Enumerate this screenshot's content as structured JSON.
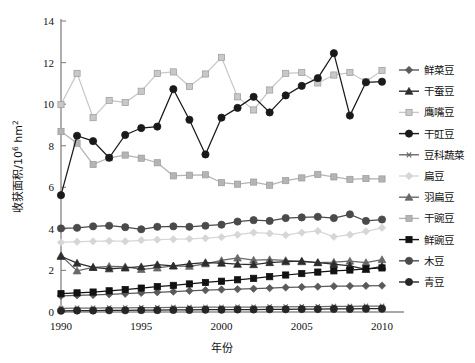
{
  "chart_data": {
    "type": "line",
    "title": "",
    "xlabel": "年份",
    "ylabel": "收获面积/10⁶ hm²",
    "ylabel_main": "收获面积/10",
    "ylabel_exp": "6",
    "ylabel_unit": " hm",
    "ylabel_unit_exp": "2",
    "xlim": [
      1990,
      2010
    ],
    "ylim": [
      0,
      14
    ],
    "ytick_values": [
      0,
      2,
      4,
      6,
      8,
      10,
      12,
      14
    ],
    "ytick_labels": [
      "0",
      "2",
      "4",
      "6",
      "8",
      "10",
      "12",
      "14"
    ],
    "xtick_values": [
      1990,
      1995,
      2000,
      2005,
      2010
    ],
    "xtick_labels": [
      "1990",
      "1995",
      "2000",
      "2005",
      "2010"
    ],
    "grid": false,
    "legend_position": "right",
    "x": [
      1990,
      1991,
      1992,
      1993,
      1994,
      1995,
      1996,
      1997,
      1998,
      1999,
      2000,
      2001,
      2002,
      2003,
      2004,
      2005,
      2006,
      2007,
      2008,
      2009,
      2010
    ],
    "series": [
      {
        "name": "鲜菜豆",
        "marker": "diamond",
        "color": "#5a5a5a",
        "values": [
          0.78,
          0.8,
          0.82,
          0.85,
          0.88,
          0.92,
          0.95,
          0.98,
          1.02,
          1.05,
          1.08,
          1.1,
          1.12,
          1.15,
          1.18,
          1.2,
          1.22,
          1.24,
          1.25,
          1.26,
          1.27
        ]
      },
      {
        "name": "干蚕豆",
        "marker": "triangle",
        "color": "#2d2d2d",
        "values": [
          2.68,
          2.35,
          2.15,
          2.08,
          2.12,
          2.18,
          2.28,
          2.22,
          2.32,
          2.38,
          2.35,
          2.3,
          2.28,
          2.38,
          2.42,
          2.45,
          2.38,
          2.3,
          2.22,
          2.05,
          2.2
        ]
      },
      {
        "name": "鹰嘴豆",
        "marker": "square",
        "color": "#c8c8c8",
        "values": [
          9.98,
          11.48,
          9.35,
          10.18,
          10.08,
          10.62,
          11.48,
          11.55,
          10.85,
          11.45,
          12.25,
          10.35,
          9.72,
          10.68,
          11.48,
          11.52,
          11.02,
          11.4,
          11.52,
          11.08,
          11.62
        ]
      },
      {
        "name": "干豇豆",
        "marker": "circle-filled",
        "color": "#1a1a1a",
        "values": [
          5.62,
          8.48,
          8.22,
          7.42,
          8.52,
          8.85,
          8.92,
          10.72,
          9.25,
          7.58,
          9.35,
          9.82,
          10.35,
          9.6,
          10.42,
          10.88,
          11.25,
          12.45,
          9.45,
          11.05,
          11.08
        ]
      },
      {
        "name": "豆科蔬菜",
        "marker": "asterisk",
        "color": "#6a6a6a",
        "values": [
          0.18,
          0.19,
          0.19,
          0.2,
          0.2,
          0.21,
          0.21,
          0.22,
          0.22,
          0.23,
          0.23,
          0.24,
          0.24,
          0.25,
          0.25,
          0.26,
          0.26,
          0.27,
          0.27,
          0.28,
          0.28
        ]
      },
      {
        "name": "扁豆",
        "marker": "diamond",
        "color": "#d6d6d6",
        "values": [
          3.35,
          3.38,
          3.4,
          3.42,
          3.4,
          3.45,
          3.48,
          3.5,
          3.52,
          3.55,
          3.6,
          3.72,
          3.82,
          3.78,
          3.7,
          3.82,
          3.9,
          3.62,
          3.72,
          3.88,
          4.05
        ]
      },
      {
        "name": "羽扁豆",
        "marker": "triangle",
        "color": "#686868",
        "values": [
          2.72,
          1.98,
          2.15,
          2.2,
          2.18,
          2.05,
          2.12,
          2.22,
          2.2,
          2.32,
          2.48,
          2.6,
          2.5,
          2.52,
          2.48,
          2.42,
          2.38,
          2.4,
          2.45,
          2.38,
          2.52
        ]
      },
      {
        "name": "干豌豆",
        "marker": "square",
        "color": "#b4b4b4",
        "values": [
          8.68,
          8.12,
          7.1,
          7.42,
          7.55,
          7.4,
          7.18,
          6.55,
          6.58,
          6.6,
          6.22,
          6.15,
          6.25,
          6.1,
          6.32,
          6.45,
          6.62,
          6.5,
          6.38,
          6.42,
          6.4
        ]
      },
      {
        "name": "鲜豌豆",
        "marker": "square-filled",
        "color": "#121212",
        "values": [
          0.88,
          0.92,
          0.96,
          1.02,
          1.08,
          1.15,
          1.22,
          1.28,
          1.35,
          1.42,
          1.48,
          1.55,
          1.62,
          1.7,
          1.78,
          1.85,
          1.92,
          1.98,
          2.02,
          2.08,
          2.12
        ]
      },
      {
        "name": "木豆",
        "marker": "circle-filled",
        "color": "#4a4a4a",
        "values": [
          4.02,
          4.05,
          4.12,
          4.15,
          4.08,
          3.98,
          4.1,
          4.12,
          4.1,
          4.15,
          4.2,
          4.35,
          4.42,
          4.38,
          4.52,
          4.55,
          4.58,
          4.52,
          4.7,
          4.38,
          4.45
        ]
      },
      {
        "name": "青豆",
        "marker": "circle-filled",
        "color": "#262626",
        "values": [
          0.06,
          0.07,
          0.07,
          0.08,
          0.08,
          0.09,
          0.09,
          0.1,
          0.1,
          0.11,
          0.11,
          0.12,
          0.12,
          0.13,
          0.13,
          0.14,
          0.14,
          0.15,
          0.15,
          0.16,
          0.16
        ]
      }
    ]
  }
}
